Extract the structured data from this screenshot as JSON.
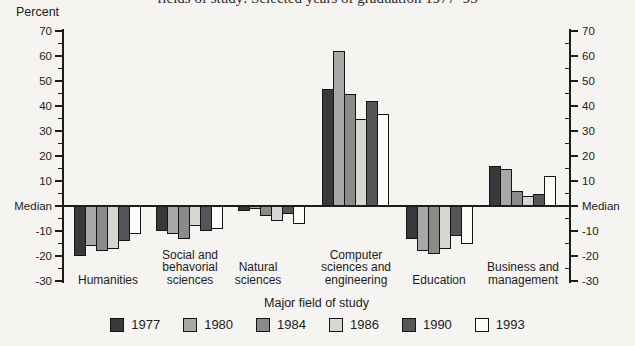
{
  "header": {
    "clipped_title": "fields of study:  Selected years of graduation 1977–93"
  },
  "chart_data": {
    "type": "bar",
    "ylabel_top": "Percent",
    "xlabel": "Major field of study",
    "ylim": [
      -30,
      70
    ],
    "ytick_values": [
      70,
      60,
      50,
      40,
      30,
      20,
      10,
      0,
      -10,
      -20,
      -30
    ],
    "minor_tick_interval": 5,
    "zero_label": "Median",
    "grid": false,
    "legend_position": "bottom",
    "axis_color": "#1c1c1c",
    "categories": [
      {
        "label_lines": [
          "Humanities"
        ]
      },
      {
        "label_lines": [
          "Social and",
          "behavorial",
          "sciences"
        ]
      },
      {
        "label_lines": [
          "Natural",
          "sciences"
        ]
      },
      {
        "label_lines": [
          "Computer",
          "sciences and",
          "engineering"
        ]
      },
      {
        "label_lines": [
          "Education"
        ]
      },
      {
        "label_lines": [
          "Business and",
          "management"
        ]
      }
    ],
    "series": [
      {
        "name": "1977",
        "color": "#39393b",
        "values": [
          -20,
          -10,
          -2,
          47,
          -13,
          16
        ]
      },
      {
        "name": "1980",
        "color": "#a8a8a6",
        "values": [
          -16,
          -11,
          -1,
          62,
          -18,
          15
        ]
      },
      {
        "name": "1984",
        "color": "#8b8b89",
        "values": [
          -18,
          -13,
          -4,
          45,
          -19,
          6
        ]
      },
      {
        "name": "1986",
        "color": "#d7d6d2",
        "values": [
          -17,
          -8,
          -6,
          35,
          -17,
          4
        ]
      },
      {
        "name": "1990",
        "color": "#56565a",
        "values": [
          -14,
          -10,
          -3,
          42,
          -12,
          5
        ]
      },
      {
        "name": "1993",
        "color": "#fcfcf9",
        "values": [
          -11,
          -9,
          -7,
          37,
          -15,
          12
        ]
      }
    ]
  }
}
